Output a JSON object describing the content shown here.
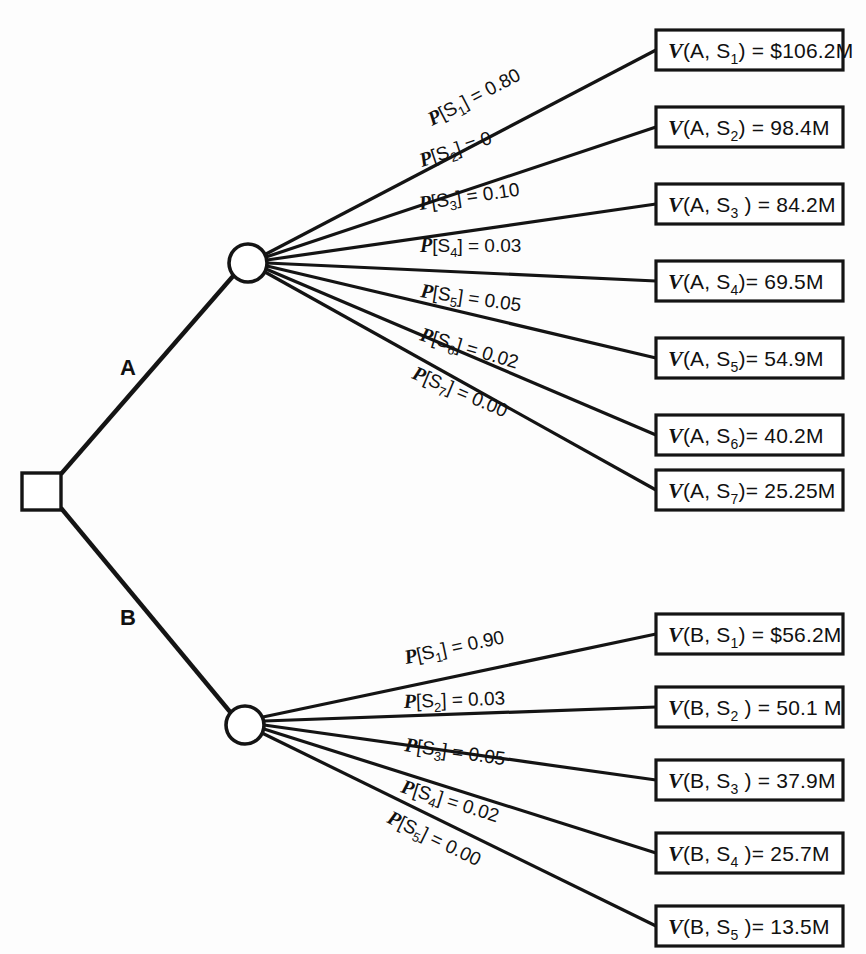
{
  "diagram": {
    "root_node_type": "decision-square",
    "colors": {
      "line": "#141414",
      "background": "#ffffff",
      "text": "#111111"
    }
  },
  "branches": [
    {
      "id": "A",
      "label": "A",
      "node_type": "chance-circle",
      "outcomes": [
        {
          "prob_var": "P",
          "state": "S",
          "state_index": "1",
          "prob_value": "0.80",
          "payoff_var": "V",
          "payoff_args": "(A, S",
          "payoff_index": "1",
          "payoff_tail": ") = $106.2M",
          "prob_label": "P[S1] = 0.80",
          "payoff_label": "V(A, S1) = $106.2M"
        },
        {
          "prob_var": "P",
          "state": "S",
          "state_index": "2",
          "prob_value": "0",
          "payoff_var": "V",
          "payoff_args": "(A, S",
          "payoff_index": "2",
          "payoff_tail": ") = 98.4M",
          "prob_label": "P[S2] = 0",
          "payoff_label": "V(A, S2) = 98.4M"
        },
        {
          "prob_var": "P",
          "state": "S",
          "state_index": "3",
          "prob_value": "0.10",
          "payoff_var": "V",
          "payoff_args": "(A, S",
          "payoff_index": "3",
          "payoff_tail": " ) = 84.2M",
          "prob_label": "P[S3] = 0.10",
          "payoff_label": "V(A, S3 ) = 84.2M"
        },
        {
          "prob_var": "P",
          "state": "S",
          "state_index": "4",
          "prob_value": "0.03",
          "payoff_var": "V",
          "payoff_args": "(A, S",
          "payoff_index": "4",
          "payoff_tail": ")= 69.5M",
          "prob_label": "P[S4] = 0.03",
          "payoff_label": "V(A, S4)= 69.5M"
        },
        {
          "prob_var": "P",
          "state": "S",
          "state_index": "5",
          "prob_value": "0.05",
          "payoff_var": "V",
          "payoff_args": "(A, S",
          "payoff_index": "5",
          "payoff_tail": ")= 54.9M",
          "prob_label": "P[S5] = 0.05",
          "payoff_label": "V(A, S5)= 54.9M"
        },
        {
          "prob_var": "P",
          "state": "S",
          "state_index": "6",
          "prob_value": "0.02",
          "payoff_var": "V",
          "payoff_args": "(A, S",
          "payoff_index": "6",
          "payoff_tail": ")= 40.2M",
          "prob_label": "P[S6] = 0.02",
          "payoff_label": "V(A, S6)= 40.2M"
        },
        {
          "prob_var": "P",
          "state": "S",
          "state_index": "7",
          "prob_value": "0.00",
          "payoff_var": "V",
          "payoff_args": "(A, S",
          "payoff_index": "7",
          "payoff_tail": ")= 25.25M",
          "prob_label": "P[S7] = 0.00",
          "payoff_label": "V(A, S7)= 25.25M"
        }
      ]
    },
    {
      "id": "B",
      "label": "B",
      "node_type": "chance-circle",
      "outcomes": [
        {
          "prob_var": "P",
          "state": "S",
          "state_index": "1",
          "prob_value": "0.90",
          "payoff_var": "V",
          "payoff_args": "(B, S",
          "payoff_index": "1",
          "payoff_tail": ") = $56.2M",
          "prob_label": "P[S1] = 0.90",
          "payoff_label": "V(B, S1) = $56.2M"
        },
        {
          "prob_var": "P",
          "state": "S",
          "state_index": "2",
          "prob_value": "0.03",
          "payoff_var": "V",
          "payoff_args": "(B, S",
          "payoff_index": "2",
          "payoff_tail": " ) = 50.1 M",
          "prob_label": "P[S2] = 0.03",
          "payoff_label": "V(B, S2 ) = 50.1 M"
        },
        {
          "prob_var": "P",
          "state": "S",
          "state_index": "3",
          "prob_value": "0.05",
          "payoff_var": "V",
          "payoff_args": "(B, S",
          "payoff_index": "3",
          "payoff_tail": " ) = 37.9M",
          "prob_label": "P[S3] = 0.05",
          "payoff_label": "V(B, S3 ) = 37.9M"
        },
        {
          "prob_var": "P",
          "state": "S",
          "state_index": "4",
          "prob_value": "0.02",
          "payoff_var": "V",
          "payoff_args": "(B, S",
          "payoff_index": "4",
          "payoff_tail": " )= 25.7M",
          "prob_label": "P[S4] = 0.02",
          "payoff_label": "V(B, S4 )= 25.7M"
        },
        {
          "prob_var": "P",
          "state": "S",
          "state_index": "5",
          "prob_value": "0.00",
          "payoff_var": "V",
          "payoff_args": "(B, S",
          "payoff_index": "5",
          "payoff_tail": " )= 13.5M",
          "prob_label": "P[S5] = 0.00",
          "payoff_label": "V(B, S5 )= 13.5M"
        }
      ]
    }
  ]
}
